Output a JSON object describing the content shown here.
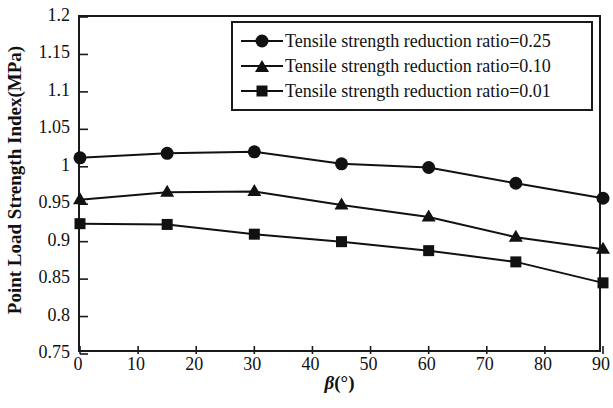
{
  "chart_data": {
    "type": "line",
    "title": "",
    "xlabel": "β(°)",
    "ylabel": "Point Load Strength Index(MPa)",
    "x": [
      0,
      15,
      30,
      45,
      60,
      75,
      90
    ],
    "xlim": [
      0,
      90
    ],
    "ylim": [
      0.75,
      1.2
    ],
    "xticks": [
      "0",
      "10",
      "20",
      "30",
      "40",
      "50",
      "60",
      "70",
      "80",
      "90"
    ],
    "xtick_values": [
      0,
      10,
      20,
      30,
      40,
      50,
      60,
      70,
      80,
      90
    ],
    "yticks": [
      "0.75",
      "0.8",
      "0.85",
      "0.9",
      "0.95",
      "1",
      "1.05",
      "1.1",
      "1.15",
      "1.2"
    ],
    "ytick_values": [
      0.75,
      0.8,
      0.85,
      0.9,
      0.95,
      1.0,
      1.05,
      1.1,
      1.15,
      1.2
    ],
    "grid": false,
    "legend_position": "top-right",
    "series": [
      {
        "name": "Tensile strength reduction ratio=0.25",
        "marker": "circle",
        "values": [
          1.012,
          1.018,
          1.02,
          1.004,
          0.999,
          0.978,
          0.958
        ]
      },
      {
        "name": "Tensile strength reduction ratio=0.10",
        "marker": "triangle",
        "values": [
          0.956,
          0.966,
          0.967,
          0.949,
          0.933,
          0.906,
          0.89
        ]
      },
      {
        "name": "Tensile strength reduction ratio=0.01",
        "marker": "square",
        "values": [
          0.924,
          0.923,
          0.91,
          0.9,
          0.888,
          0.873,
          0.845
        ]
      }
    ],
    "line_color": "#111111",
    "marker_color": "#111111",
    "axis_color": "#1a1a1a"
  },
  "legend": {
    "items": [
      {
        "label": "Tensile strength reduction ratio=0.25",
        "marker": "circle-marker"
      },
      {
        "label": "Tensile strength reduction ratio=0.10",
        "marker": "triangle-marker"
      },
      {
        "label": "Tensile strength reduction ratio=0.01",
        "marker": "square-marker"
      }
    ]
  },
  "axes": {
    "x_title_prefix": "β",
    "x_title_suffix": "(°)",
    "y_title": "Point Load Strength Index(MPa)"
  }
}
